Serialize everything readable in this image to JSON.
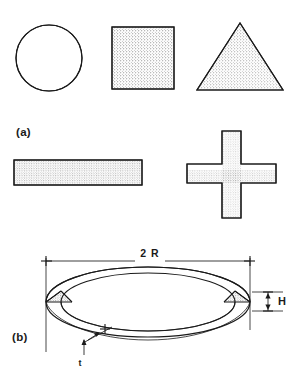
{
  "figure": {
    "background_color": "#ffffff",
    "line_color": "#1a1a1a",
    "stipple_color": "#555555",
    "panels": [
      {
        "id": "a",
        "label": "(a)",
        "description": "Set of cross-section profile shapes with stippled shading",
        "shapes": [
          {
            "name": "circle",
            "label": "circle-shape"
          },
          {
            "name": "square",
            "label": "square-shape"
          },
          {
            "name": "triangle",
            "label": "triangle-shape"
          },
          {
            "name": "rectangle",
            "label": "rectangular-bar-shape"
          },
          {
            "name": "cross",
            "label": "cross-shape"
          }
        ]
      },
      {
        "id": "b",
        "label": "(b)",
        "description": "Toroidal ring in perspective with dimension callouts",
        "dimensions": [
          {
            "symbol": "2 R",
            "name": "outer-diameter",
            "orientation": "horizontal"
          },
          {
            "symbol": "H",
            "name": "ring-height",
            "orientation": "vertical"
          },
          {
            "symbol": "t",
            "name": "wall-thickness",
            "orientation": "leader"
          }
        ]
      }
    ]
  },
  "labels": {
    "panel_a": "(a)",
    "panel_b": "(b)",
    "diameter": "2 R",
    "height": "H",
    "thickness": "t"
  },
  "icons": {
    "circle": "circle-icon",
    "square": "square-icon",
    "triangle": "triangle-icon",
    "rectangle": "rectangle-icon",
    "cross": "cross-icon",
    "ring": "torus-ring-icon"
  }
}
